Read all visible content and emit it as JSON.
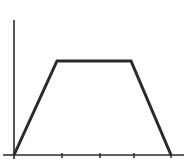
{
  "chart_data": {
    "type": "line",
    "title": "",
    "xlabel": "",
    "ylabel": "",
    "x": [
      0,
      0.9,
      2.5,
      4
    ],
    "values": [
      0,
      1,
      1,
      0
    ],
    "series": [
      {
        "name": "profile",
        "x": [
          0,
          0.9,
          2.5,
          4
        ],
        "values": [
          0,
          1,
          1,
          0
        ]
      }
    ],
    "x_ticks": [
      0,
      1,
      2,
      3,
      4
    ],
    "x_tick_labels": [],
    "y_ticks": [],
    "y_tick_labels": [],
    "xlim": [
      -0.25,
      4.3
    ],
    "ylim": [
      0,
      1.45
    ],
    "grid": false,
    "legend": null,
    "shape": "trapezoid"
  },
  "colors": {
    "axis": "#2a2a2a",
    "line": "#2a2a2a",
    "background": "#ffffff"
  },
  "layout": {
    "origin": [
      14,
      155
    ],
    "x_axis_start": 3,
    "x_axis_end": 184,
    "y_axis_top": 20,
    "tick_px": [
      14,
      62,
      100,
      134,
      171
    ],
    "profile_px": [
      [
        14,
        155
      ],
      [
        57,
        61
      ],
      [
        131,
        61
      ],
      [
        171,
        155
      ]
    ]
  }
}
